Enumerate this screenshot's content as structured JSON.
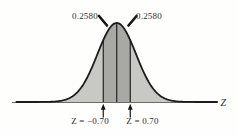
{
  "chart_data": {
    "type": "area",
    "title": "",
    "xlabel": "Z",
    "distribution": "standard normal curve",
    "z_range": [
      -5.2,
      5.2
    ],
    "z_boundaries": [
      -0.7,
      0,
      0.7
    ],
    "areas": [
      {
        "from_z": -0.7,
        "to_z": 0,
        "area": 0.258
      },
      {
        "from_z": 0,
        "to_z": 0.7,
        "area": 0.258
      }
    ],
    "grid": false,
    "legend": "none",
    "labels": {
      "area_left": "0.2580",
      "area_right": "0.2580",
      "z_left": "Z = −0.70",
      "z_right": "Z = 0.70",
      "axis": "Z"
    },
    "colors": {
      "outer_fill": "#c8c8c5",
      "band_fill": "#a8a8a5",
      "curve_stroke": "#1c1c1c",
      "axis": "#5a5a58",
      "marker": "#161616",
      "text": "#2e2e2c",
      "background": "#fefefd"
    }
  }
}
